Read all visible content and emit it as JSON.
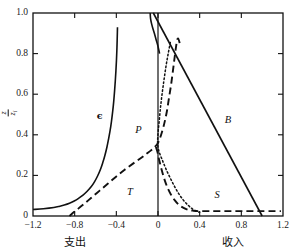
{
  "chart_data": {
    "type": "line",
    "title": "",
    "xlabel_left": "支出",
    "xlabel_right": "收入",
    "ylabel": "z/z_i",
    "ylabel_numerator": "z",
    "ylabel_denominator": "z",
    "ylabel_denominator_sub": "i",
    "xlim": [
      -1.2,
      1.2
    ],
    "ylim": [
      0,
      1.0
    ],
    "grid": false,
    "legend": "inline-curve-labels",
    "xticks": [
      "-1.2",
      "-0.8",
      "-0.4",
      "0",
      "0.4",
      "0.8",
      "1.2"
    ],
    "xtick_values": [
      -1.2,
      -0.8,
      -0.4,
      0,
      0.4,
      0.8,
      1.2
    ],
    "yticks": [
      "0",
      "0.2",
      "0.4",
      "0.6",
      "0.8",
      "1.0"
    ],
    "ytick_values": [
      0,
      0.2,
      0.4,
      0.6,
      0.8,
      1.0
    ],
    "zero_line_x": 0,
    "series": [
      {
        "name": "epsilon",
        "label": "ϵ",
        "style": "solid",
        "label_x": -0.56,
        "label_y": 0.49,
        "points": [
          [
            -1.2,
            0.032
          ],
          [
            -1.1,
            0.036
          ],
          [
            -1.0,
            0.042
          ],
          [
            -0.95,
            0.047
          ],
          [
            -0.9,
            0.054
          ],
          [
            -0.85,
            0.063
          ],
          [
            -0.8,
            0.075
          ],
          [
            -0.76,
            0.088
          ],
          [
            -0.72,
            0.103
          ],
          [
            -0.68,
            0.122
          ],
          [
            -0.64,
            0.145
          ],
          [
            -0.61,
            0.168
          ],
          [
            -0.58,
            0.197
          ],
          [
            -0.55,
            0.233
          ],
          [
            -0.53,
            0.263
          ],
          [
            -0.51,
            0.298
          ],
          [
            -0.49,
            0.34
          ],
          [
            -0.475,
            0.378
          ],
          [
            -0.46,
            0.42
          ],
          [
            -0.447,
            0.465
          ],
          [
            -0.435,
            0.515
          ],
          [
            -0.425,
            0.565
          ],
          [
            -0.417,
            0.615
          ],
          [
            -0.41,
            0.665
          ],
          [
            -0.404,
            0.715
          ],
          [
            -0.399,
            0.765
          ],
          [
            -0.395,
            0.815
          ],
          [
            -0.392,
            0.865
          ],
          [
            -0.39,
            0.905
          ],
          [
            -0.389,
            0.93
          ]
        ]
      },
      {
        "name": "B-budget",
        "label": "B",
        "style": "solid",
        "label_x": 0.67,
        "label_y": 0.47,
        "points": [
          [
            -0.045,
            1.0
          ],
          [
            1.0,
            0.0
          ]
        ]
      },
      {
        "name": "top-solid-hook",
        "label": "",
        "style": "solid",
        "points": [
          [
            -0.075,
            1.0
          ],
          [
            -0.072,
            0.975
          ],
          [
            -0.063,
            0.95
          ],
          [
            -0.05,
            0.925
          ],
          [
            -0.035,
            0.9
          ],
          [
            -0.02,
            0.872
          ],
          [
            -0.002,
            0.84
          ],
          [
            0.015,
            0.8
          ]
        ]
      },
      {
        "name": "T-transport",
        "label": "T",
        "style": "dashed",
        "label_x": -0.27,
        "label_y": 0.115,
        "points": [
          [
            -0.85,
            0.0
          ],
          [
            -0.8,
            0.022
          ],
          [
            -0.72,
            0.055
          ],
          [
            -0.64,
            0.09
          ],
          [
            -0.56,
            0.125
          ],
          [
            -0.48,
            0.16
          ],
          [
            -0.4,
            0.195
          ],
          [
            -0.32,
            0.228
          ],
          [
            -0.24,
            0.258
          ],
          [
            -0.17,
            0.283
          ],
          [
            -0.115,
            0.305
          ],
          [
            -0.07,
            0.322
          ],
          [
            -0.035,
            0.338
          ],
          [
            0.0,
            0.36
          ],
          [
            0.03,
            0.4
          ],
          [
            0.06,
            0.455
          ],
          [
            0.085,
            0.515
          ],
          [
            0.105,
            0.58
          ],
          [
            0.125,
            0.645
          ],
          [
            0.142,
            0.71
          ],
          [
            0.158,
            0.775
          ],
          [
            0.172,
            0.83
          ],
          [
            0.183,
            0.865
          ],
          [
            0.193,
            0.875
          ],
          [
            0.203,
            0.862
          ],
          [
            0.212,
            0.84
          ]
        ]
      },
      {
        "name": "P-profit",
        "label": "P",
        "style": "dotted",
        "label_x": -0.19,
        "label_y": 0.42,
        "points": [
          [
            0.118,
            0.855
          ],
          [
            0.098,
            0.8
          ],
          [
            0.079,
            0.745
          ],
          [
            0.063,
            0.69
          ],
          [
            0.048,
            0.635
          ],
          [
            0.034,
            0.58
          ],
          [
            0.022,
            0.525
          ],
          [
            0.012,
            0.47
          ],
          [
            0.003,
            0.425
          ],
          [
            -0.002,
            0.39
          ],
          [
            -0.004,
            0.365
          ],
          [
            -0.0015,
            0.345
          ],
          [
            0.006,
            0.325
          ],
          [
            0.018,
            0.305
          ],
          [
            0.034,
            0.285
          ],
          [
            0.055,
            0.258
          ],
          [
            0.082,
            0.225
          ],
          [
            0.115,
            0.19
          ],
          [
            0.152,
            0.152
          ],
          [
            0.193,
            0.115
          ],
          [
            0.238,
            0.082
          ],
          [
            0.285,
            0.055
          ],
          [
            0.33,
            0.035
          ],
          [
            0.375,
            0.022
          ],
          [
            0.4,
            0.018
          ]
        ]
      },
      {
        "name": "S-saving",
        "label": "S",
        "style": "dashed",
        "label_x": 0.57,
        "label_y": 0.1,
        "points": [
          [
            -0.02,
            0.34
          ],
          [
            -0.005,
            0.315
          ],
          [
            0.005,
            0.29
          ],
          [
            0.018,
            0.262
          ],
          [
            0.033,
            0.232
          ],
          [
            0.05,
            0.2
          ],
          [
            0.07,
            0.168
          ],
          [
            0.095,
            0.135
          ],
          [
            0.125,
            0.105
          ],
          [
            0.16,
            0.078
          ],
          [
            0.2,
            0.055
          ],
          [
            0.245,
            0.04
          ],
          [
            0.29,
            0.03
          ],
          [
            0.34,
            0.026
          ],
          [
            0.4,
            0.024
          ],
          [
            0.5,
            0.024
          ],
          [
            0.62,
            0.024
          ],
          [
            0.74,
            0.024
          ],
          [
            0.86,
            0.024
          ],
          [
            0.98,
            0.024
          ],
          [
            1.1,
            0.024
          ],
          [
            1.18,
            0.024
          ]
        ]
      }
    ]
  }
}
